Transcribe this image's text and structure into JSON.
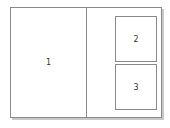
{
  "diagram": {
    "type": "window-layout",
    "panes": [
      {
        "id": "pane-1",
        "label": "1"
      },
      {
        "id": "pane-2",
        "label": "2"
      },
      {
        "id": "pane-3",
        "label": "3"
      }
    ],
    "colors": {
      "border": "#8a8a8a",
      "shadow": "#c8c8c8",
      "background": "#ffffff",
      "text": "#333333"
    }
  }
}
